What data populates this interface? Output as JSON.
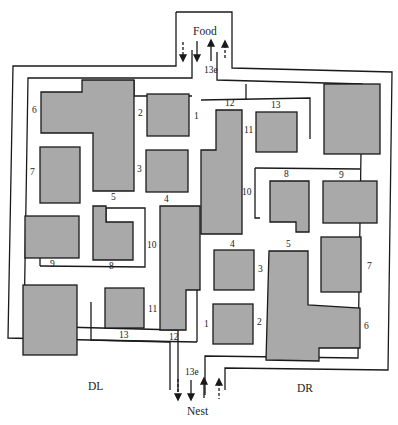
{
  "diagram": {
    "type": "maze",
    "endpoints": {
      "top": "Food",
      "bottom": "Nest"
    },
    "regions": {
      "left": "DL",
      "right": "DR"
    },
    "entry_labels": {
      "top": "13e",
      "bottom": "13e"
    },
    "colors": {
      "block": "#a9a9a9",
      "wall": "#1a1a1a",
      "background": "#ffffff"
    },
    "arrows": {
      "top": [
        "dashed-down",
        "solid-down",
        "solid-up",
        "dashed-up"
      ],
      "bottom": [
        "dashed-down",
        "solid-down",
        "solid-up",
        "dashed-up"
      ]
    },
    "upper_left_labels": [
      "1",
      "2",
      "3",
      "4",
      "5",
      "6",
      "7"
    ],
    "upper_right_labels": [
      "8",
      "9",
      "10",
      "11",
      "12",
      "13"
    ],
    "lower_left_labels": [
      "8",
      "9",
      "10",
      "11",
      "12",
      "13"
    ],
    "lower_right_labels": [
      "1",
      "2",
      "3",
      "4",
      "5",
      "6",
      "7"
    ]
  }
}
